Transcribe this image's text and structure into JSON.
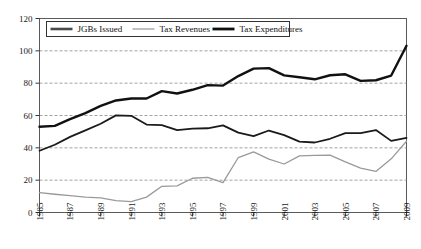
{
  "chart_data": {
    "type": "line",
    "title": "",
    "subtitle": "",
    "xlabel": "",
    "ylabel": "",
    "xlim": [
      1985,
      2009
    ],
    "ylim": [
      0,
      120
    ],
    "yticks": [
      0,
      20,
      40,
      60,
      80,
      100,
      120
    ],
    "xticks": [
      1985,
      1987,
      1989,
      1991,
      1993,
      1995,
      1997,
      1999,
      2001,
      2003,
      2005,
      2007,
      2009
    ],
    "xtick_labels": [
      "1985",
      "1987",
      "1989",
      "1991",
      "1993",
      "1995",
      "1997",
      "1999",
      "2001",
      "2003",
      "2005",
      "2007",
      "2009"
    ],
    "ytick_labels": [
      "0",
      "20",
      "40",
      "60",
      "80",
      "100",
      "120"
    ],
    "grid": "horizontal-dashed",
    "legend_position": "top-left-inside",
    "x": [
      1985,
      1986,
      1987,
      1988,
      1989,
      1990,
      1991,
      1992,
      1993,
      1994,
      1995,
      1996,
      1997,
      1998,
      1999,
      2000,
      2001,
      2002,
      2003,
      2004,
      2005,
      2006,
      2007,
      2008,
      2009
    ],
    "series": [
      {
        "name": "JGBs Issued",
        "color": "#9a9a9a",
        "width": 1.3,
        "values": [
          12.3,
          11.3,
          10.5,
          9.5,
          9.1,
          7.3,
          6.7,
          9.5,
          16.2,
          16.5,
          21.2,
          21.7,
          18.5,
          34.0,
          37.5,
          33.0,
          30.0,
          35.0,
          35.3,
          35.5,
          31.3,
          27.5,
          25.4,
          33.2,
          44.1
        ]
      },
      {
        "name": "Tax Revenues",
        "color": "#1a1a1a",
        "width": 1.8,
        "values": [
          38.2,
          41.9,
          46.8,
          50.8,
          54.9,
          60.1,
          59.8,
          54.4,
          54.1,
          51.0,
          51.9,
          52.1,
          53.9,
          49.4,
          47.2,
          50.7,
          47.9,
          43.8,
          43.3,
          45.6,
          49.1,
          49.1,
          51.0,
          44.3,
          46.1
        ]
      },
      {
        "name": "Tax Expenditures",
        "color": "#111111",
        "width": 2.4,
        "values": [
          53.0,
          53.6,
          57.7,
          61.5,
          65.9,
          69.3,
          70.5,
          70.5,
          75.1,
          73.6,
          75.9,
          78.8,
          78.5,
          84.4,
          89.0,
          89.3,
          84.8,
          83.7,
          82.4,
          84.9,
          85.5,
          81.4,
          81.8,
          84.7,
          103.1
        ]
      }
    ],
    "legend": [
      {
        "label": "JGBs Issued",
        "color": "#4a4a4a",
        "width": 2.6
      },
      {
        "label": "Tax Revenues",
        "color": "#b0b0b0",
        "width": 1.6
      },
      {
        "label": "Tax Expenditures",
        "color": "#111111",
        "width": 2.8
      }
    ]
  },
  "axes": {
    "y_title": "",
    "x_title": ""
  }
}
